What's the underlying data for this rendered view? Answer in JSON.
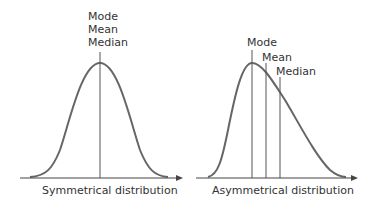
{
  "diagram": {
    "symmetrical": {
      "caption": "Symmetrical distribution",
      "labels": [
        "Mode",
        "Mean",
        "Median"
      ]
    },
    "asymmetrical": {
      "caption": "Asymmetrical distribution",
      "labels": {
        "mode": "Mode",
        "mean": "Mean",
        "median": "Median"
      }
    }
  },
  "colors": {
    "curve": "#666666",
    "lines": "#555555",
    "text": "#333333",
    "background": "#ffffff"
  }
}
